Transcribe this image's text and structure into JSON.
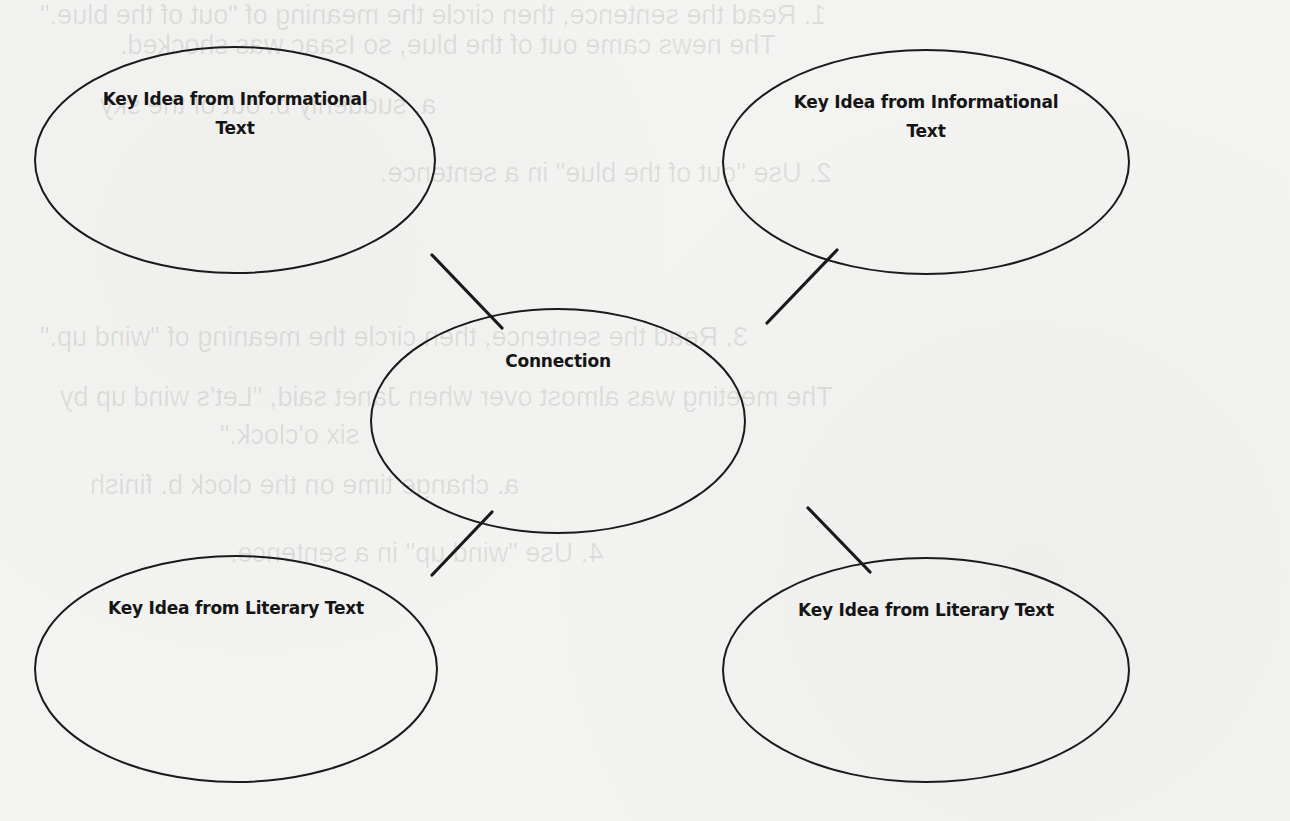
{
  "diagram": {
    "type": "concept-map",
    "style": {
      "stroke_color": "#1a1a1a",
      "paper_color": "#f3f3f1",
      "text_color": "#151515"
    },
    "nodes": [
      {
        "id": "info-1",
        "label_line1": "Key Idea from Informational",
        "label_line2": "Text",
        "cx": 235,
        "cy": 160,
        "rx": 200,
        "ry": 113
      },
      {
        "id": "info-2",
        "label_line1": "Key Idea from Informational",
        "label_line2": "Text",
        "cx": 926,
        "cy": 162,
        "rx": 203,
        "ry": 112
      },
      {
        "id": "connection",
        "label_line1": "Connection",
        "label_line2": "",
        "cx": 558,
        "cy": 421,
        "rx": 187,
        "ry": 112
      },
      {
        "id": "literary-1",
        "label_line1": "Key Idea from Literary Text",
        "label_line2": "",
        "cx": 236,
        "cy": 669,
        "rx": 201,
        "ry": 113
      },
      {
        "id": "literary-2",
        "label_line1": "Key Idea from Literary Text",
        "label_line2": "",
        "cx": 926,
        "cy": 670,
        "rx": 203,
        "ry": 112
      }
    ],
    "edges": [
      {
        "from": "info-1",
        "to": "connection",
        "x1": 432,
        "y1": 255,
        "x2": 502,
        "y2": 328
      },
      {
        "from": "info-2",
        "to": "connection",
        "x1": 837,
        "y1": 250,
        "x2": 767,
        "y2": 323
      },
      {
        "from": "connection",
        "to": "literary-1",
        "x1": 492,
        "y1": 512,
        "x2": 432,
        "y2": 575
      },
      {
        "from": "connection",
        "to": "literary-2",
        "x1": 808,
        "y1": 508,
        "x2": 870,
        "y2": 572
      }
    ]
  },
  "show_through_text": [
    "1. Read the sentence, then circle the meaning of \"out of the blue.\"",
    "The news came out of the blue, so Isaac was shocked.",
    "a. suddenly                              b. out of the sky",
    "2. Use \"out of the blue\" in a sentence.",
    "3. Read the sentence, then circle the meaning of \"wind up.\"",
    "The meeting was almost over when Janet said, \"Let's wind up by",
    "six o'clock.\"",
    "a. change time on the clock          b. finish",
    "4. Use \"wind up\" in a sentence."
  ]
}
